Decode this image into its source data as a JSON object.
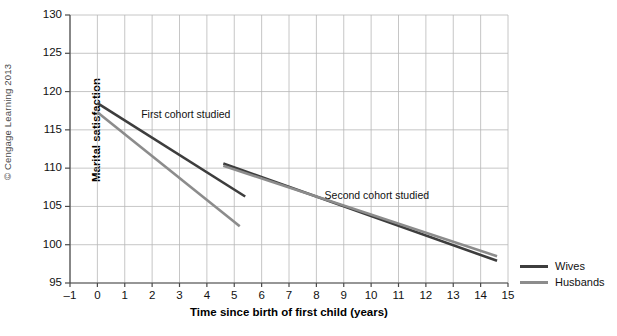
{
  "figure": {
    "credit": "© Cengage Learning 2013",
    "legend": {
      "position": "right",
      "items": [
        {
          "label": "Wives",
          "color": "#3d3d3d"
        },
        {
          "label": "Husbands",
          "color": "#8c8c8c"
        }
      ]
    }
  },
  "chart_data": {
    "type": "line",
    "title": "",
    "xlabel": "Time since birth of first child (years)",
    "ylabel": "Marital satisfaction",
    "xlim": [
      -1,
      15
    ],
    "ylim": [
      95,
      130
    ],
    "xticks": [
      "-1",
      "0",
      "1",
      "2",
      "3",
      "4",
      "5",
      "6",
      "7",
      "8",
      "9",
      "10",
      "11",
      "12",
      "13",
      "14",
      "15"
    ],
    "yticks": [
      "95",
      "100",
      "105",
      "110",
      "115",
      "120",
      "125",
      "130"
    ],
    "grid": true,
    "legend_position": "right",
    "annotations": [
      {
        "text": "First cohort studied",
        "x": 1.6,
        "y": 117.0
      },
      {
        "text": "Second cohort studied",
        "x": 8.3,
        "y": 106.4
      }
    ],
    "series": [
      {
        "name": "Wives",
        "cohort": "First cohort studied",
        "color": "#3d3d3d",
        "x": [
          0,
          5.4
        ],
        "values": [
          118.5,
          106.3
        ]
      },
      {
        "name": "Husbands",
        "cohort": "First cohort studied",
        "color": "#8c8c8c",
        "x": [
          0,
          5.2
        ],
        "values": [
          117.3,
          102.4
        ]
      },
      {
        "name": "Wives",
        "cohort": "Second cohort studied",
        "color": "#3d3d3d",
        "x": [
          4.6,
          14.6
        ],
        "values": [
          110.6,
          97.9
        ]
      },
      {
        "name": "Husbands",
        "cohort": "Second cohort studied",
        "color": "#8c8c8c",
        "x": [
          4.6,
          14.6
        ],
        "values": [
          110.3,
          98.5
        ]
      }
    ]
  }
}
